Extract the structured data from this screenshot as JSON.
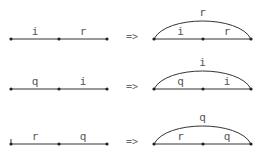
{
  "arrow_symbol": "=>",
  "rules": [
    {
      "left_labels": [
        "i",
        "r"
      ],
      "right_labels": [
        "i",
        "r"
      ],
      "arc_label": "r"
    },
    {
      "left_labels": [
        "q",
        "i"
      ],
      "right_labels": [
        "q",
        "i"
      ],
      "arc_label": "i"
    },
    {
      "left_labels": [
        "r",
        "q"
      ],
      "right_labels": [
        "r",
        "q"
      ],
      "arc_label": "q"
    }
  ],
  "colors": {
    "line": "#333333",
    "node": "#222222",
    "label": "#555555"
  }
}
